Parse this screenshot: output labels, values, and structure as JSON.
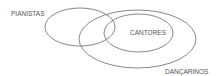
{
  "diagram": {
    "type": "venn",
    "stroke_color": "#6a6a6a",
    "text_color": "#555555",
    "sets": [
      {
        "id": "pianistas",
        "label": "PIANISTAS"
      },
      {
        "id": "cantores",
        "label": "CANTORES"
      },
      {
        "id": "dancarinos",
        "label": "DANÇARINOS"
      }
    ]
  }
}
